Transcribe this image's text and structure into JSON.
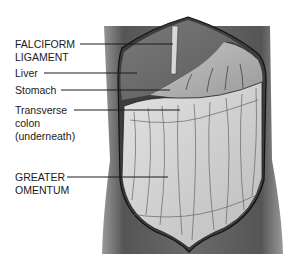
{
  "diagram": {
    "type": "anatomical-illustration",
    "colors": {
      "background": "#ffffff",
      "skin_dark": "#4a4a4a",
      "skin_mid": "#8a8a8a",
      "liver": "#6e6e6e",
      "stomach": "#a9a9a9",
      "omentum": "#d6d6d6",
      "line": "#1a1a1a"
    },
    "labels": [
      {
        "id": "falciform",
        "lines": [
          "FALCIFORM",
          "LIGAMENT"
        ]
      },
      {
        "id": "liver",
        "lines": [
          "Liver"
        ]
      },
      {
        "id": "stomach",
        "lines": [
          "Stomach"
        ]
      },
      {
        "id": "transverse-colon",
        "lines": [
          "Transverse",
          "colon",
          "(underneath)"
        ]
      },
      {
        "id": "greater-omentum",
        "lines": [
          "GREATER",
          "OMENTUM"
        ]
      }
    ]
  }
}
